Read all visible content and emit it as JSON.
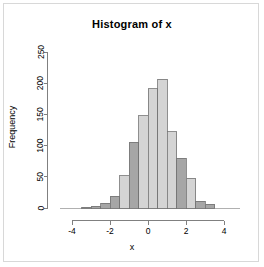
{
  "chart_data": {
    "type": "bar",
    "title": "Histogram of x",
    "xlabel": "x",
    "ylabel": "Frequency",
    "grid": false,
    "legend": null,
    "xlim": [
      -4.2,
      4.2
    ],
    "ylim": [
      0,
      250
    ],
    "xticks": [
      -4,
      -2,
      0,
      2,
      4
    ],
    "xtick_labels": [
      "-4",
      "-2",
      "0",
      "2",
      "4"
    ],
    "yticks": [
      0,
      50,
      100,
      150,
      200,
      250
    ],
    "ytick_labels": [
      "0",
      "50",
      "100",
      "150",
      "200",
      "250"
    ],
    "bin_width": 0.5,
    "bin_edges": [
      -3.5,
      -3.0,
      -2.5,
      -2.0,
      -1.5,
      -1.0,
      -0.5,
      0.0,
      0.5,
      1.0,
      1.5,
      2.0,
      2.5,
      3.0,
      3.5
    ],
    "categories": [
      "-3.5",
      "-3.0",
      "-2.5",
      "-2.0",
      "-1.5",
      "-1.0",
      "-0.5",
      "0.0",
      "0.5",
      "1.0",
      "1.5",
      "2.0",
      "2.5",
      "3.0"
    ],
    "values": [
      1,
      3,
      8,
      19,
      52,
      105,
      148,
      191,
      206,
      122,
      80,
      48,
      11,
      6
    ],
    "bar_fill_light": "#d4d4d4",
    "bar_fill_dark": "#a6a6a6",
    "bar_stroke": "#737373",
    "axis_color": "#808080",
    "bars": [
      {
        "left": -3.5,
        "right": -3.0,
        "value": 1,
        "shade": "dark"
      },
      {
        "left": -3.0,
        "right": -2.5,
        "value": 3,
        "shade": "dark"
      },
      {
        "left": -2.5,
        "right": -2.0,
        "value": 8,
        "shade": "dark"
      },
      {
        "left": -2.0,
        "right": -1.5,
        "value": 19,
        "shade": "dark"
      },
      {
        "left": -1.5,
        "right": -1.0,
        "value": 52,
        "shade": "light"
      },
      {
        "left": -1.0,
        "right": -0.5,
        "value": 105,
        "shade": "dark"
      },
      {
        "left": -0.5,
        "right": 0.0,
        "value": 148,
        "shade": "light"
      },
      {
        "left": 0.0,
        "right": 0.5,
        "value": 191,
        "shade": "light"
      },
      {
        "left": 0.5,
        "right": 1.0,
        "value": 206,
        "shade": "light"
      },
      {
        "left": 1.0,
        "right": 1.5,
        "value": 122,
        "shade": "light"
      },
      {
        "left": 1.5,
        "right": 2.0,
        "value": 80,
        "shade": "dark"
      },
      {
        "left": 2.0,
        "right": 2.5,
        "value": 48,
        "shade": "light"
      },
      {
        "left": 2.5,
        "right": 3.0,
        "value": 11,
        "shade": "dark"
      },
      {
        "left": 3.0,
        "right": 3.5,
        "value": 6,
        "shade": "dark"
      }
    ]
  }
}
